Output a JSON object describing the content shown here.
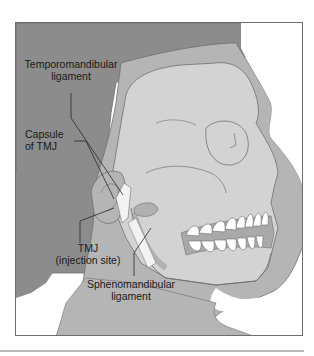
{
  "figure": {
    "colors": {
      "hair": "#8c8c8c",
      "skin": "#b5b5b5",
      "bone": "#d3d3d3",
      "outline": "#707070",
      "background": "#ffffff",
      "text": "#1a1a1a",
      "ligament": "#f2f2f2",
      "teeth": "#ffffff"
    },
    "labels": [
      {
        "id": "temporomandibular-ligament",
        "line1": "Temporomandibular",
        "line2": "ligament"
      },
      {
        "id": "capsule-of-tmj",
        "line1": "Capsule",
        "line2": "of TMJ"
      },
      {
        "id": "tmj-injection-site",
        "line1": "TMJ",
        "line2": "(injection site)"
      },
      {
        "id": "sphenomandibular-ligament",
        "line1": "Sphenomandibular",
        "line2": "ligament"
      }
    ]
  }
}
